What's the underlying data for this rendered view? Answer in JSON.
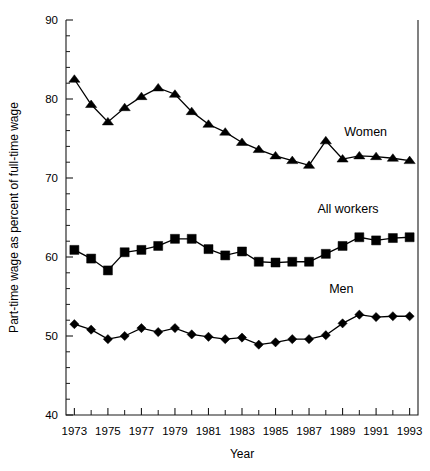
{
  "chart_data": {
    "type": "line",
    "title": "",
    "xlabel": "Year",
    "ylabel": "Part-time wage as percent of full-time wage",
    "xlim": [
      1972.5,
      1993.5
    ],
    "ylim": [
      40,
      90
    ],
    "ytick_labels": [
      "40",
      "50",
      "60",
      "70",
      "80",
      "90"
    ],
    "ytick_values": [
      40,
      50,
      60,
      70,
      80,
      90
    ],
    "yminor_step": 2,
    "xtick_labels": [
      "1973",
      "1975",
      "1977",
      "1979",
      "1981",
      "1983",
      "1985",
      "1987",
      "1989",
      "1991",
      "1993"
    ],
    "xtick_values": [
      1973,
      1975,
      1977,
      1979,
      1981,
      1983,
      1985,
      1987,
      1989,
      1991,
      1993
    ],
    "xminor_step": 1,
    "grid": false,
    "legend_position": "inline-annotations",
    "x": [
      1973,
      1974,
      1975,
      1976,
      1977,
      1978,
      1979,
      1980,
      1981,
      1982,
      1983,
      1984,
      1985,
      1986,
      1987,
      1988,
      1989,
      1990,
      1991,
      1992,
      1993
    ],
    "series": [
      {
        "name": "Women",
        "marker": "triangle",
        "label_x": 1989.1,
        "label_y": 75.3,
        "values": [
          82.5,
          79.3,
          77.1,
          78.9,
          80.3,
          81.4,
          80.6,
          78.4,
          76.8,
          75.8,
          74.5,
          73.6,
          72.8,
          72.2,
          71.6,
          74.7,
          72.4,
          72.8,
          72.7,
          72.5,
          72.2
        ]
      },
      {
        "name": "All workers",
        "marker": "square",
        "label_x": 1987.5,
        "label_y": 65.6,
        "values": [
          60.9,
          59.8,
          58.3,
          60.6,
          60.9,
          61.4,
          62.3,
          62.3,
          61.0,
          60.2,
          60.7,
          59.4,
          59.3,
          59.4,
          59.4,
          60.4,
          61.4,
          62.5,
          62.1,
          62.4,
          62.5
        ]
      },
      {
        "name": "Men",
        "marker": "diamond",
        "label_x": 1988.2,
        "label_y": 55.4,
        "values": [
          51.5,
          50.8,
          49.6,
          50.0,
          51.0,
          50.5,
          51.0,
          50.2,
          49.9,
          49.6,
          49.8,
          48.9,
          49.2,
          49.6,
          49.6,
          50.1,
          51.6,
          52.7,
          52.4,
          52.5,
          52.5
        ]
      }
    ]
  }
}
